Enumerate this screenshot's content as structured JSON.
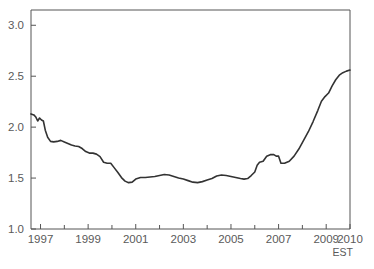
{
  "chart_data": {
    "type": "line",
    "title": "",
    "subtitle": "",
    "xlabel": "EST",
    "ylabel": "",
    "xlim": [
      1996.6,
      2010.0
    ],
    "ylim": [
      1.0,
      3.15
    ],
    "grid": false,
    "legend": null,
    "yticks": [
      "1.0",
      "1.5",
      "2.0",
      "2.5",
      "3.0"
    ],
    "ytick_values": [
      1.0,
      1.5,
      2.0,
      2.5,
      3.0
    ],
    "xticks": [
      "1997",
      "1999",
      "2001",
      "2003",
      "2005",
      "2007",
      "2009",
      "2010"
    ],
    "xtick_values": [
      1997,
      1999,
      2001,
      2003,
      2005,
      2007,
      2009,
      2010
    ],
    "xminor_values": [
      1998,
      2000,
      2002,
      2004,
      2006,
      2008
    ],
    "annotations": [
      {
        "text": "EST",
        "x": 2010,
        "y": 1.0,
        "position": "below-right-axis"
      }
    ],
    "series": [
      {
        "name": "EST",
        "color": "#333333",
        "x": [
          1996.6,
          1996.72,
          1996.8,
          1996.88,
          1996.96,
          1997.04,
          1997.12,
          1997.2,
          1997.3,
          1997.42,
          1997.55,
          1997.7,
          1997.85,
          1998.0,
          1998.15,
          1998.3,
          1998.45,
          1998.6,
          1998.75,
          1998.9,
          1999.05,
          1999.2,
          1999.35,
          1999.5,
          1999.65,
          1999.8,
          1999.95,
          2000.1,
          2000.25,
          2000.4,
          2000.55,
          2000.7,
          2000.85,
          2001.0,
          2001.2,
          2001.4,
          2001.6,
          2001.8,
          2002.0,
          2002.2,
          2002.4,
          2002.6,
          2002.8,
          2003.0,
          2003.2,
          2003.4,
          2003.6,
          2003.8,
          2004.0,
          2004.2,
          2004.4,
          2004.6,
          2004.8,
          2005.0,
          2005.2,
          2005.4,
          2005.55,
          2005.7,
          2005.85,
          2006.0,
          2006.1,
          2006.2,
          2006.35,
          2006.5,
          2006.65,
          2006.8,
          2006.9,
          2007.0,
          2007.1,
          2007.25,
          2007.45,
          2007.65,
          2007.85,
          2008.05,
          2008.25,
          2008.45,
          2008.65,
          2008.8,
          2008.95,
          2009.1,
          2009.25,
          2009.4,
          2009.55,
          2009.7,
          2009.85,
          2010.0
        ],
        "y": [
          2.13,
          2.12,
          2.1,
          2.06,
          2.09,
          2.07,
          2.06,
          1.97,
          1.9,
          1.86,
          1.855,
          1.86,
          1.87,
          1.855,
          1.84,
          1.825,
          1.815,
          1.81,
          1.79,
          1.76,
          1.745,
          1.745,
          1.735,
          1.71,
          1.655,
          1.645,
          1.645,
          1.6,
          1.555,
          1.505,
          1.47,
          1.455,
          1.46,
          1.49,
          1.505,
          1.505,
          1.51,
          1.515,
          1.525,
          1.535,
          1.53,
          1.515,
          1.5,
          1.49,
          1.475,
          1.46,
          1.455,
          1.465,
          1.48,
          1.495,
          1.52,
          1.53,
          1.525,
          1.515,
          1.505,
          1.495,
          1.49,
          1.495,
          1.525,
          1.56,
          1.625,
          1.655,
          1.665,
          1.715,
          1.73,
          1.73,
          1.715,
          1.715,
          1.645,
          1.645,
          1.665,
          1.715,
          1.785,
          1.87,
          1.955,
          2.055,
          2.165,
          2.255,
          2.3,
          2.335,
          2.405,
          2.465,
          2.51,
          2.535,
          2.55,
          2.56
        ]
      }
    ]
  },
  "axes": {
    "frame_color": "#555555",
    "text_color": "#5a5a5a",
    "line_color": "#333333",
    "background": "#ffffff"
  }
}
